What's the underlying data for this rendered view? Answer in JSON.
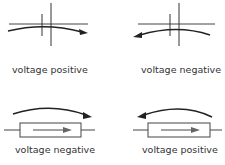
{
  "diagram": {
    "colors": {
      "stroke": "#333333",
      "arrow": "#222222",
      "text": "#333333",
      "background": "#ffffff"
    },
    "panels": [
      {
        "id": "capacitor-forward",
        "element": "capacitor",
        "arrow_direction": "right",
        "label": "voltage positive"
      },
      {
        "id": "capacitor-backward",
        "element": "capacitor",
        "arrow_direction": "left",
        "label": "voltage negative"
      },
      {
        "id": "resistor-forward",
        "element": "resistor",
        "arrow_direction": "right",
        "inner_arrow": "right",
        "label": "voltage negative"
      },
      {
        "id": "resistor-backward",
        "element": "resistor",
        "arrow_direction": "left",
        "inner_arrow": "right",
        "label": "voltage positive"
      }
    ]
  }
}
